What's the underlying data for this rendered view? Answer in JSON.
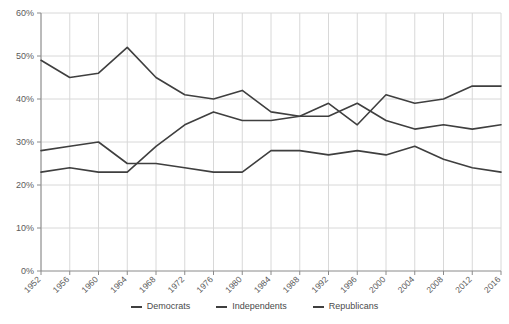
{
  "chart_data": {
    "type": "line",
    "title": "",
    "xlabel": "",
    "ylabel": "",
    "ylim": [
      0,
      60
    ],
    "grid": true,
    "legend_position": "bottom",
    "ytick_labels": [
      "60%",
      "50%",
      "40%",
      "30%",
      "20%",
      "10%",
      "0%"
    ],
    "ytick_values": [
      60,
      50,
      40,
      30,
      20,
      10,
      0
    ],
    "categories": [
      "1952",
      "1956",
      "1960",
      "1964",
      "1968",
      "1972",
      "1976",
      "1980",
      "1984",
      "1988",
      "1992",
      "1996",
      "2000",
      "2004",
      "2008",
      "2012",
      "2016"
    ],
    "series": [
      {
        "name": "Democrats",
        "values": [
          49,
          45,
          46,
          52,
          45,
          41,
          40,
          42,
          37,
          36,
          36,
          39,
          35,
          33,
          34,
          33,
          34
        ]
      },
      {
        "name": "Independents",
        "values": [
          23,
          24,
          23,
          23,
          29,
          34,
          37,
          35,
          35,
          36,
          39,
          34,
          41,
          39,
          40,
          43,
          43
        ]
      },
      {
        "name": "Republicans",
        "values": [
          28,
          29,
          30,
          25,
          25,
          24,
          23,
          23,
          28,
          28,
          27,
          28,
          27,
          29,
          26,
          24,
          23
        ]
      }
    ]
  },
  "legend": {
    "items": [
      {
        "label": "Democrats"
      },
      {
        "label": "Independents"
      },
      {
        "label": "Republicans"
      }
    ]
  }
}
